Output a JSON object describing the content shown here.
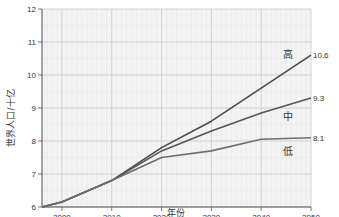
{
  "chart_data": {
    "type": "line",
    "title": "",
    "xlabel": "年份",
    "ylabel": "世界人口/十亿",
    "xlim": [
      1996,
      2050
    ],
    "ylim": [
      6,
      12
    ],
    "xticks": [
      2000,
      2010,
      2020,
      2030,
      2040,
      2050
    ],
    "yticks": [
      6,
      7,
      8,
      9,
      10,
      11,
      12
    ],
    "grid": true,
    "legend": "inline labels at right",
    "x": [
      1996,
      2000,
      2010,
      2020,
      2030,
      2040,
      2050
    ],
    "series": [
      {
        "name": "高",
        "end_label": "10.6",
        "color": "#4a4a4a",
        "values": [
          6.0,
          6.15,
          6.8,
          7.8,
          8.6,
          9.6,
          10.6
        ]
      },
      {
        "name": "中",
        "end_label": "9.3",
        "color": "#555555",
        "values": [
          6.0,
          6.15,
          6.8,
          7.7,
          8.3,
          8.85,
          9.3
        ]
      },
      {
        "name": "低",
        "end_label": "8.1",
        "color": "#6e6e6e",
        "values": [
          6.0,
          6.15,
          6.8,
          7.5,
          7.7,
          8.05,
          8.1
        ]
      }
    ]
  },
  "colors": {
    "plot_bg": "#f3f3f3",
    "grid_major": "#c8c8c8",
    "grid_minor": "#e6e6e6",
    "axis": "#555555"
  }
}
